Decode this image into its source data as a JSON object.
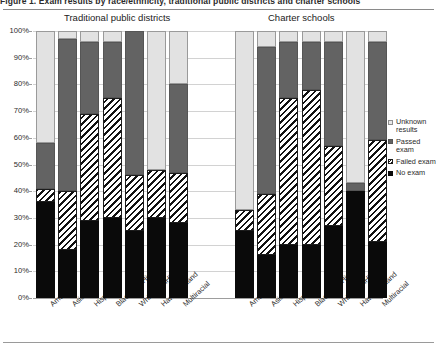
{
  "figure": {
    "caption": "Figure 1. Exam results by race/ethnicity, traditional public districts and charter schools",
    "panels": [
      {
        "id": "traditional",
        "title": "Traditional public districts"
      },
      {
        "id": "charter",
        "title": "Charter schools"
      }
    ]
  },
  "legend": {
    "position": "right",
    "items": [
      {
        "key": "unknown",
        "label": "Unknown results",
        "swatch": "unknown-swatch",
        "color": "#e2e2e2"
      },
      {
        "key": "passed",
        "label": "Passed exam",
        "swatch": "passed-swatch",
        "color": "#636363"
      },
      {
        "key": "failed",
        "label": "Failed exam",
        "swatch": "failed-swatch",
        "color": "#ffffff"
      },
      {
        "key": "noexam",
        "label": "No exam",
        "swatch": "noexam-swatch",
        "color": "#0a0a0a"
      }
    ]
  },
  "axis": {
    "y_ticks": [
      "0%",
      "10%",
      "20%",
      "30%",
      "40%",
      "50%",
      "60%",
      "70%",
      "80%",
      "90%",
      "100%"
    ],
    "y_values": [
      0,
      10,
      20,
      30,
      40,
      50,
      60,
      70,
      80,
      90,
      100
    ],
    "ymin": 0,
    "ymax": 100,
    "grid": true
  },
  "chart_data": {
    "type": "bar",
    "stacked": true,
    "stack_total": 100,
    "title": "Figure 1. Exam results by race/ethnicity, traditional public districts and charter schools",
    "xlabel": "",
    "ylabel": "",
    "ylim": [
      0,
      100
    ],
    "grid": true,
    "legend_position": "right",
    "categories": [
      "AmerInd",
      "Asian",
      "Hispanic",
      "Black_nonHisp",
      "White_nonHisp",
      "HawPacIsland",
      "Multiracial"
    ],
    "panels": [
      {
        "name": "Traditional public districts",
        "series": [
          {
            "name": "No exam",
            "values": [
              36,
              18,
              29,
              30,
              25,
              30,
              28
            ]
          },
          {
            "name": "Failed exam",
            "values": [
              5,
              22,
              40,
              45,
              21,
              18,
              19
            ]
          },
          {
            "name": "Passed exam",
            "values": [
              17,
              57,
              27,
              21,
              54,
              0,
              33
            ]
          },
          {
            "name": "Unknown results",
            "values": [
              42,
              3,
              4,
              4,
              0,
              52,
              20
            ]
          }
        ]
      },
      {
        "name": "Charter schools",
        "series": [
          {
            "name": "No exam",
            "values": [
              25,
              16,
              20,
              20,
              27,
              40,
              21
            ]
          },
          {
            "name": "Failed exam",
            "values": [
              8,
              23,
              55,
              58,
              30,
              0,
              38
            ]
          },
          {
            "name": "Passed exam",
            "values": [
              0,
              55,
              21,
              18,
              39,
              3,
              37
            ]
          },
          {
            "name": "Unknown results",
            "values": [
              67,
              6,
              4,
              4,
              4,
              57,
              4
            ]
          }
        ]
      }
    ]
  }
}
